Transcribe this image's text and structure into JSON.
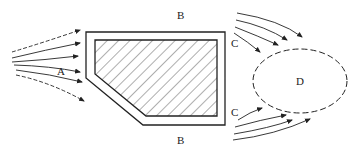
{
  "diagram": {
    "labels": {
      "A": "A",
      "B_top": "B",
      "B_bottom": "B",
      "C_top": "C",
      "C_bottom": "C",
      "D": "D"
    },
    "colors": {
      "stroke": "#222222",
      "background": "#ffffff"
    }
  }
}
